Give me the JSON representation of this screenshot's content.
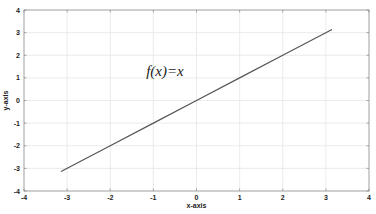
{
  "chart_data": {
    "type": "line",
    "title": "",
    "xlabel": "x-axis",
    "ylabel": "y-axis",
    "xlim": [
      -4,
      4
    ],
    "ylim": [
      -4,
      4
    ],
    "xticks": [
      -4,
      -3,
      -2,
      -1,
      0,
      1,
      2,
      3,
      4
    ],
    "yticks": [
      -4,
      -3,
      -2,
      -1,
      0,
      1,
      2,
      3,
      4
    ],
    "xtick_labels": [
      "-4",
      "-3",
      "-2",
      "-1",
      "0",
      "1",
      "2",
      "3",
      "4"
    ],
    "ytick_labels": [
      "-4",
      "-3",
      "-2",
      "-1",
      "0",
      "1",
      "2",
      "3",
      "4"
    ],
    "grid": true,
    "legend": null,
    "annotations": [
      {
        "text": "f(x)=x",
        "x": -0.75,
        "y": 1.3
      }
    ],
    "series": [
      {
        "name": "f(x)=x",
        "color": "#555555",
        "x": [
          -3.1416,
          -2,
          -1,
          0,
          1,
          2,
          3.1416
        ],
        "y": [
          -3.1416,
          -2,
          -1,
          0,
          1,
          2,
          3.1416
        ]
      }
    ]
  },
  "colors": {
    "background": "#ffffff",
    "axes": "#888888",
    "grid": "#e6e6e6",
    "line": "#555555",
    "text": "#222222"
  }
}
